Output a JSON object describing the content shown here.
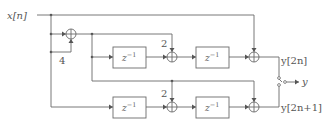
{
  "diagram": {
    "input_label": "x[n]",
    "output_label": "y",
    "output_even_label": "y[2n]",
    "output_odd_label": "y[2n+1]",
    "gain_input": "4",
    "gain_top": "2",
    "gain_bottom": "2",
    "delay_label": "z",
    "delay_exponent": "−1",
    "adder_symbol": "+",
    "blocks": [
      {
        "id": "delay-top-left",
        "label": "z^-1"
      },
      {
        "id": "delay-top-right",
        "label": "z^-1"
      },
      {
        "id": "delay-bottom-left",
        "label": "z^-1"
      },
      {
        "id": "delay-bottom-right",
        "label": "z^-1"
      }
    ],
    "colors": {
      "line": "#6a6a6a",
      "text": "#555555"
    }
  }
}
